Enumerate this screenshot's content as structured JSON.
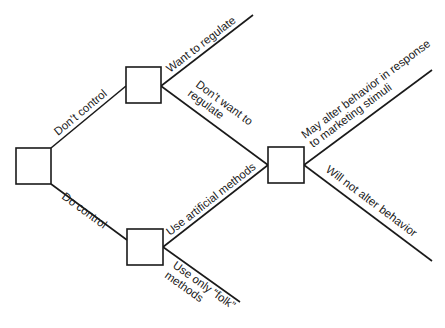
{
  "diagram": {
    "type": "decision-tree",
    "nodes": [
      {
        "id": "root"
      },
      {
        "id": "dont-control-node"
      },
      {
        "id": "do-control-node"
      },
      {
        "id": "response-node"
      }
    ],
    "edges": {
      "dont_control": "Don’t control",
      "do_control": "Do control",
      "want_to_regulate": "Want to regulate",
      "dont_want_to_regulate_1": "Don’t want to",
      "dont_want_to_regulate_2": "regulate",
      "use_artificial_methods": "Use artificial methods",
      "use_only_folk_1": "Use only “folk”",
      "use_only_folk_2": "methods",
      "may_alter_1": "May alter behavior in response",
      "may_alter_2": "to marketing stimuli",
      "will_not_alter": "Will not alter behavior"
    }
  }
}
